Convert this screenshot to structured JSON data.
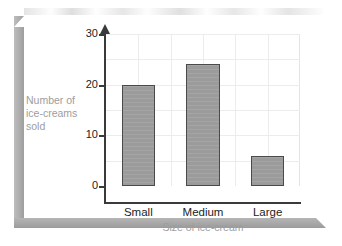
{
  "page": {
    "background_color": "#ffffff",
    "bevel_color": "#a9a9a9"
  },
  "chart_data": {
    "type": "bar",
    "title": "",
    "subtitle": "",
    "categories": [
      "Small",
      "Medium",
      "Large"
    ],
    "values": [
      20,
      24,
      6
    ],
    "series": [
      {
        "name": "Number of ice-creams sold",
        "values": [
          20,
          24,
          6
        ]
      }
    ],
    "xlabel": "Size of ice-cream",
    "ylabel": "Number of ice-creams sold",
    "ylabel_lines": [
      "Number of",
      "ice-creams",
      "sold"
    ],
    "ylim": [
      0,
      30
    ],
    "y_major_ticks": [
      0,
      10,
      20,
      30
    ],
    "y_minor_step": 5,
    "y_tick_labels": [
      "0",
      "10",
      "20",
      "30"
    ],
    "grid": true,
    "grid_color": "#ececec",
    "legend": "none",
    "bar_fill_color": "#9b9b9b",
    "bar_border_color": "#4a4a4a",
    "axis_color": "#3a3a3a",
    "label_color": "#232323",
    "axis_title_color": "#9d9d9d",
    "y_axis_arrow": true
  }
}
